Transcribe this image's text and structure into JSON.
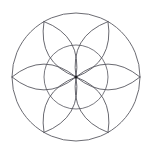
{
  "figure": {
    "background_color": "#ffffff",
    "stroke_color": "#55555c",
    "center_dot_color": "#1c1c20",
    "canvas": {
      "width": 153,
      "height": 153
    }
  },
  "chart_data": {
    "type": "scatter",
    "xlabel": "",
    "ylabel": "",
    "xlim": [
      0,
      153
    ],
    "ylim": [
      0,
      153
    ],
    "grid": false,
    "legend": null,
    "center": {
      "x": 76,
      "y": 77
    },
    "circles": [
      {
        "name": "outer-circle",
        "cx": 76,
        "cy": 77,
        "r": 64,
        "stroke": "#5a5a62"
      },
      {
        "name": "inner-circle",
        "cx": 76,
        "cy": 77,
        "r": 32,
        "stroke": "#5f5f67"
      }
    ],
    "petal_count": 6,
    "petal_tip_radius": 64,
    "petal_arc_bulge": 26,
    "petal_tip_angles_deg": [
      0,
      60,
      120,
      180,
      240,
      300
    ],
    "petal_tips": [
      {
        "angle_deg": 0,
        "x": 140,
        "y": 77
      },
      {
        "angle_deg": 60,
        "x": 108,
        "y": 22
      },
      {
        "angle_deg": 120,
        "x": 44,
        "y": 22
      },
      {
        "angle_deg": 180,
        "x": 12,
        "y": 77
      },
      {
        "angle_deg": 240,
        "x": 44,
        "y": 132
      },
      {
        "angle_deg": 300,
        "x": 108,
        "y": 132
      }
    ]
  }
}
